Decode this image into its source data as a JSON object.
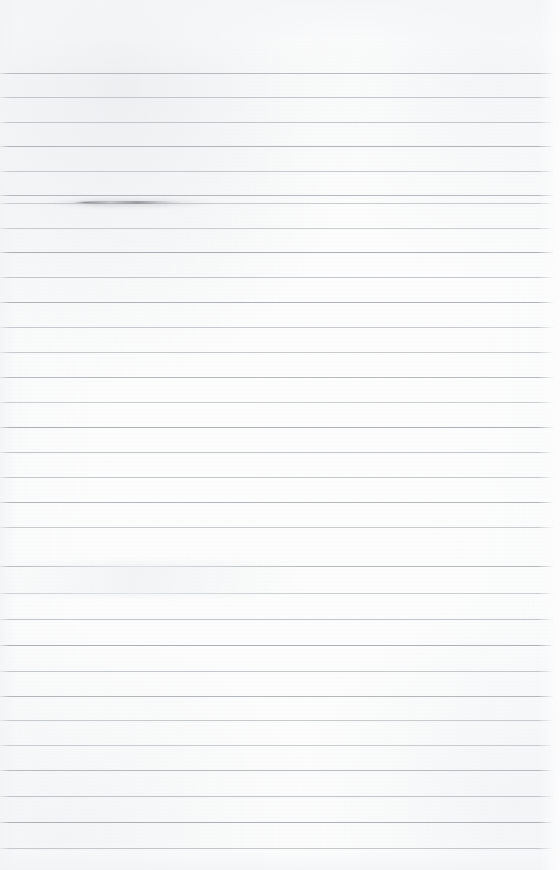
{
  "document": {
    "kind": "scanned-ruled-notebook-page",
    "title": "Blank Ruled Paper Scan",
    "text_content": "",
    "handwriting_present": "no",
    "printed_text_present": "no",
    "page_width_px": 560,
    "page_height_px": 870
  },
  "colors": {
    "paper": "#fdfdfd",
    "rule_line": "#bfc3c7",
    "rule_line_dark": "#a9adb1",
    "scan_vignette": "#e8eaed",
    "smudge": "#7a7e82"
  },
  "ruling": {
    "style": "wide-ruled-horizontal",
    "orientation": "portrait",
    "line_count": 32,
    "first_line_y": 73,
    "nominal_spacing_px": 24.5,
    "line_thickness_px": 1,
    "left_margin_px": 0,
    "right_margin_px": 7,
    "top_margin_px": 73,
    "vertical_margin_rule": "none",
    "holes_punched": "none",
    "line_positions_y": [
      73,
      97,
      122,
      146,
      171,
      195,
      203,
      228,
      252,
      277,
      302,
      327,
      352,
      377,
      402,
      427,
      452,
      477,
      502,
      527,
      566,
      593,
      619,
      645,
      671,
      696,
      720,
      745,
      770,
      796,
      822,
      848
    ],
    "line_extents": [
      {
        "x_start": 0,
        "x_end": 556
      }
    ]
  },
  "artifacts": [
    {
      "name": "ink-smudge",
      "description": "dark horizontal smudge riding along a rule line",
      "x": 72,
      "y": 201,
      "width": 112,
      "height": 3
    },
    {
      "name": "scanner-smear",
      "description": "faint diagonal light smear across the lower-middle area",
      "x": 0,
      "y": 562,
      "width": 300,
      "height": 34
    }
  ],
  "labels": {
    "page_region": "page-surface",
    "rules_region": "ruled-lines",
    "texture_region": "paper-grain"
  }
}
